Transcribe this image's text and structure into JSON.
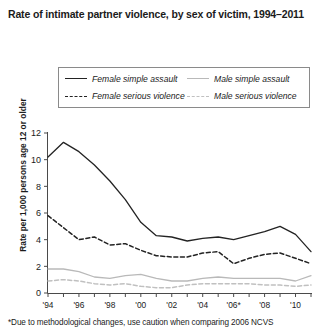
{
  "title": "Rate of intimate partner violence, by sex of victim, 1994–2011",
  "footnote": "*Due to methodological changes, use caution when comparing 2006 NCVS",
  "legend": {
    "items": [
      {
        "label": "Female simple assault",
        "style": "solid",
        "color": "#232323"
      },
      {
        "label": "Male simple assault",
        "style": "solid",
        "color": "#b9b9b9"
      },
      {
        "label": "Female serious violence",
        "style": "dashed",
        "color": "#232323"
      },
      {
        "label": "Male serious violence",
        "style": "dashed",
        "color": "#c0c0c0"
      }
    ]
  },
  "chart_data": {
    "type": "line",
    "title": "Rate of intimate partner violence, by sex of victim, 1994–2011",
    "xlabel": "",
    "ylabel": "Rate per 1,000 persons age 12 or older",
    "ylim": [
      0,
      12
    ],
    "yticks": [
      0,
      2,
      4,
      6,
      8,
      10,
      12
    ],
    "ytick_labels": [
      "0",
      "2",
      "4",
      "6",
      "8",
      "10",
      "12"
    ],
    "grid": false,
    "legend_position": "top",
    "x": [
      1994,
      1995,
      1996,
      1997,
      1998,
      1999,
      2000,
      2001,
      2002,
      2003,
      2004,
      2005,
      2006,
      2007,
      2008,
      2009,
      2010,
      2011
    ],
    "xtick_values": [
      1994,
      1996,
      1998,
      2000,
      2002,
      2004,
      2006,
      2008,
      2010
    ],
    "xtick_labels": [
      "'94",
      "'96",
      "'98",
      "'00",
      "'02",
      "'04",
      "'06*",
      "'08",
      "'10"
    ],
    "series": [
      {
        "name": "Female simple assault",
        "style": "solid",
        "color": "#232323",
        "values": [
          10.2,
          11.3,
          10.6,
          9.6,
          8.4,
          7.0,
          5.3,
          4.3,
          4.2,
          3.9,
          4.1,
          4.2,
          4.0,
          4.3,
          4.6,
          5.0,
          4.4,
          3.1
        ]
      },
      {
        "name": "Female serious violence",
        "style": "dashed",
        "color": "#232323",
        "values": [
          5.8,
          4.9,
          4.0,
          4.2,
          3.6,
          3.7,
          3.2,
          2.8,
          2.7,
          2.7,
          3.0,
          3.1,
          2.2,
          2.6,
          2.9,
          3.0,
          2.6,
          2.2
        ]
      },
      {
        "name": "Male simple assault",
        "style": "solid",
        "color": "#b9b9b9",
        "values": [
          1.8,
          1.8,
          1.6,
          1.2,
          1.1,
          1.3,
          1.4,
          1.1,
          0.9,
          0.9,
          1.1,
          1.2,
          1.1,
          1.1,
          1.1,
          1.1,
          0.9,
          1.3
        ]
      },
      {
        "name": "Male serious violence",
        "style": "dashed",
        "color": "#c0c0c0",
        "values": [
          0.9,
          1.0,
          0.9,
          0.7,
          0.6,
          0.7,
          0.5,
          0.4,
          0.4,
          0.6,
          0.7,
          0.7,
          0.7,
          0.7,
          0.6,
          0.6,
          0.5,
          0.6
        ]
      }
    ]
  }
}
